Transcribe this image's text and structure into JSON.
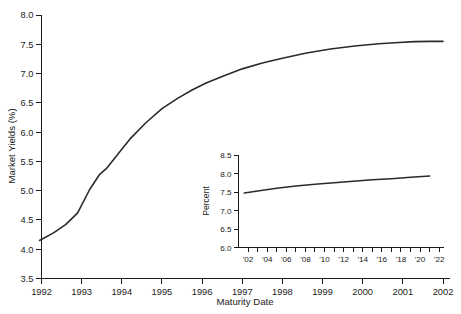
{
  "chart_data": [
    {
      "id": "main",
      "type": "line",
      "title": "",
      "xlabel": "Maturity Date",
      "ylabel": "Market Yields (%)",
      "xlim": [
        1992,
        2002
      ],
      "ylim": [
        3.5,
        8.0
      ],
      "grid": false,
      "legend": false,
      "xticklabels": [
        "1992",
        "1993",
        "1994",
        "1995",
        "1996",
        "1997",
        "1998",
        "1999",
        "2000",
        "2001",
        "2002"
      ],
      "xtickvalues": [
        1992,
        1993,
        1994,
        1995,
        1996,
        1997,
        1998,
        1999,
        2000,
        2001,
        2002
      ],
      "yticklabels": [
        "3.5",
        "4.0",
        "4.5",
        "5.0",
        "5.5",
        "6.0",
        "6.5",
        "7.0",
        "7.5",
        "8.0"
      ],
      "ytickvalues": [
        3.5,
        4.0,
        4.5,
        5.0,
        5.5,
        6.0,
        6.5,
        7.0,
        7.5,
        8.0
      ],
      "series": [
        {
          "name": "Market Yield Curve",
          "x": [
            1991.95,
            1992.3,
            1992.6,
            1992.78,
            1992.9,
            1993.2,
            1993.45,
            1993.62,
            1993.9,
            1994.2,
            1994.6,
            1995.0,
            1995.4,
            1995.75,
            1996.1,
            1996.5,
            1997.0,
            1997.5,
            1998.0,
            1998.6,
            1999.2,
            1999.8,
            2000.4,
            2000.9,
            2001.3,
            2001.7,
            2002.0
          ],
          "y": [
            4.15,
            4.28,
            4.42,
            4.54,
            4.62,
            5.02,
            5.28,
            5.38,
            5.62,
            5.88,
            6.16,
            6.4,
            6.58,
            6.72,
            6.84,
            6.95,
            7.08,
            7.18,
            7.26,
            7.35,
            7.42,
            7.47,
            7.51,
            7.53,
            7.545,
            7.55,
            7.55
          ]
        }
      ]
    },
    {
      "id": "inset",
      "type": "line",
      "title": "",
      "xlabel": "",
      "ylabel": "Percent",
      "xlim": [
        2001,
        2022.5
      ],
      "ylim": [
        6.0,
        8.5
      ],
      "grid": false,
      "legend": false,
      "xticklabels": [
        "'02",
        "'04",
        "'06",
        "'08",
        "'10",
        "'12",
        "'14",
        "'16",
        "'18",
        "'20",
        "'22"
      ],
      "xtickvalues": [
        2002,
        2004,
        2006,
        2008,
        2010,
        2012,
        2014,
        2016,
        2018,
        2020,
        2022
      ],
      "xminortickvalues": [
        2002,
        2003,
        2004,
        2005,
        2006,
        2007,
        2008,
        2009,
        2010,
        2011,
        2012,
        2013,
        2014,
        2015,
        2016,
        2017,
        2018,
        2019,
        2020,
        2021,
        2022
      ],
      "yticklabels": [
        "6.0",
        "6.5",
        "7.0",
        "7.5",
        "8.0",
        "8.5"
      ],
      "ytickvalues": [
        6.0,
        6.5,
        7.0,
        7.5,
        8.0,
        8.5
      ],
      "series": [
        {
          "name": "Long Maturity Yield Curve",
          "x": [
            2001.6,
            2003,
            2005,
            2007,
            2009,
            2011,
            2013,
            2015,
            2017,
            2019,
            2021
          ],
          "y": [
            7.47,
            7.53,
            7.6,
            7.66,
            7.71,
            7.75,
            7.79,
            7.83,
            7.86,
            7.9,
            7.93
          ]
        }
      ]
    }
  ],
  "colors": {
    "line": "#2b2b2b",
    "axis": "#1a1a1a",
    "background": "#ffffff"
  }
}
